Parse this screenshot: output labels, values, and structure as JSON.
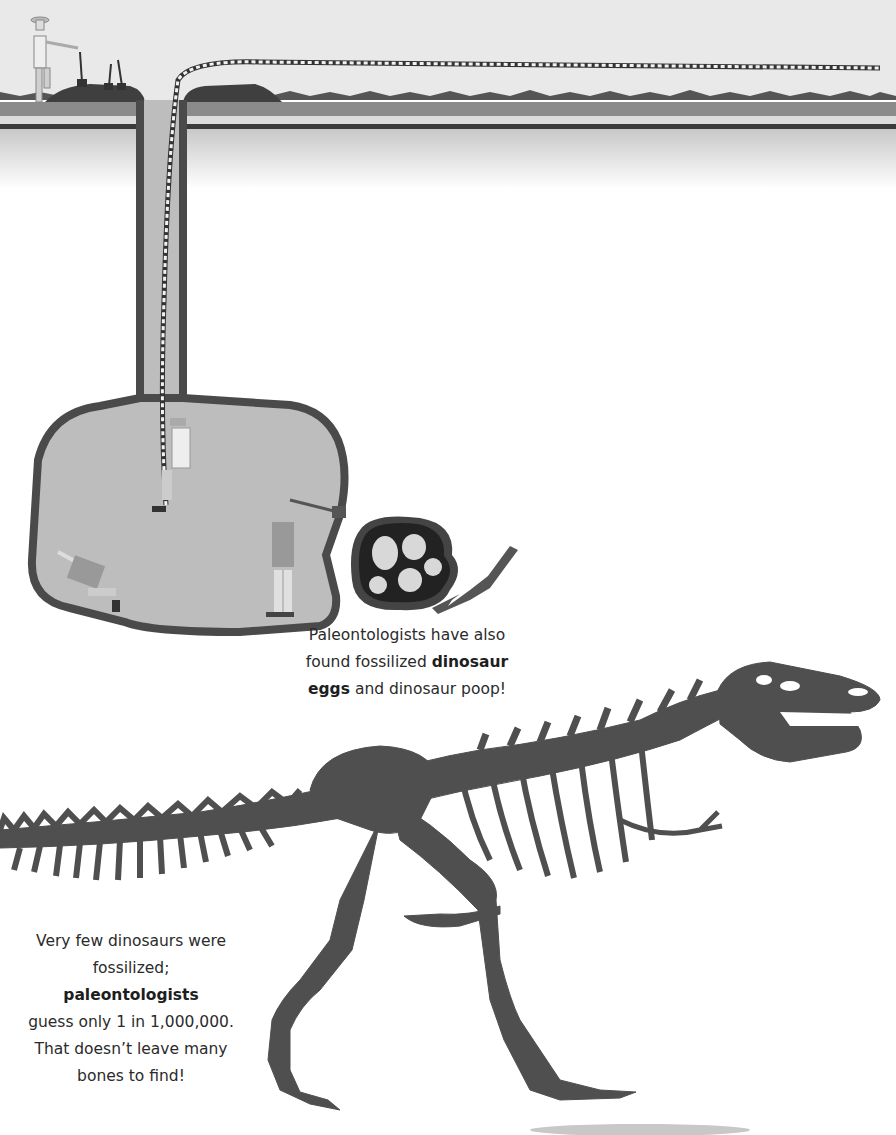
{
  "scene": {
    "description": "Cross-section illustration of a dig site with paleontologists, a rope down a shaft into a cave, dinosaur eggs nest and fossil foot; mounted Tyrannosaurus skeleton below",
    "colors": {
      "sky": "#e9e9e9",
      "ground_dark": "#8b8b8b",
      "ground_line": "#3a3a3a",
      "cave_fill": "#bdbdbd",
      "cave_outline": "#4a4a4a",
      "skeleton": "#4f4f4f",
      "text": "#2b2b2b"
    }
  },
  "captions": {
    "eggs": {
      "line1": "Paleontologists have also",
      "line2_pre": "found fossilized ",
      "line2_bold": "dinosaur",
      "line3_bold": "eggs",
      "line3_post": " and dinosaur poop!"
    },
    "fossil": {
      "line1": "Very few dinosaurs were",
      "line2_pre": "fossilized; ",
      "line2_bold": "paleontologists",
      "line3": "guess only 1 in 1,000,000.",
      "line4": "That doesn’t leave many",
      "line5": "bones to find!"
    }
  }
}
